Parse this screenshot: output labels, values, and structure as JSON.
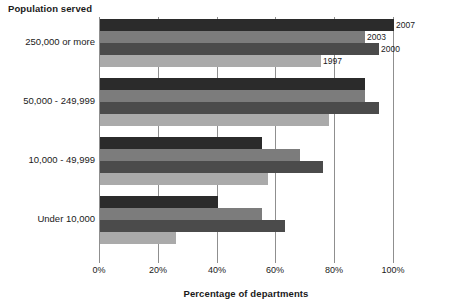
{
  "chart_data": {
    "type": "bar",
    "orientation": "horizontal",
    "title": "",
    "ylabel": "Population served",
    "xlabel": "Percentage of departments",
    "xlim": [
      0,
      100
    ],
    "xticks": [
      "0%",
      "20%",
      "40%",
      "60%",
      "80%",
      "100%"
    ],
    "xtick_values": [
      0,
      20,
      40,
      60,
      80,
      100
    ],
    "grid": true,
    "legend_position": "data-labels-at-bar-ends-first-group",
    "categories": [
      "250,000 or more",
      "50,000 - 249,999",
      "10,000 - 49,999",
      "Under 10,000"
    ],
    "series": [
      {
        "name": "2007",
        "color": "#2b2b2b",
        "values": [
          100,
          90,
          55,
          40
        ]
      },
      {
        "name": "2003",
        "color": "#7c7c7c",
        "values": [
          90,
          90,
          68,
          55
        ]
      },
      {
        "name": "2000",
        "color": "#4b4b4b",
        "values": [
          95,
          95,
          76,
          63
        ]
      },
      {
        "name": "1997",
        "color": "#aaaaaa",
        "values": [
          75,
          78,
          57,
          26
        ]
      }
    ],
    "annotations": [
      {
        "text": "2007",
        "series": "2007",
        "category": "250,000 or more"
      },
      {
        "text": "2003",
        "series": "2003",
        "category": "250,000 or more"
      },
      {
        "text": "2000",
        "series": "2000",
        "category": "250,000 or more"
      },
      {
        "text": "1997",
        "series": "1997",
        "category": "250,000 or more"
      }
    ]
  },
  "colors": {
    "axis": "#8f8f8f",
    "text": "#1a1a1a",
    "background": "#ffffff"
  }
}
